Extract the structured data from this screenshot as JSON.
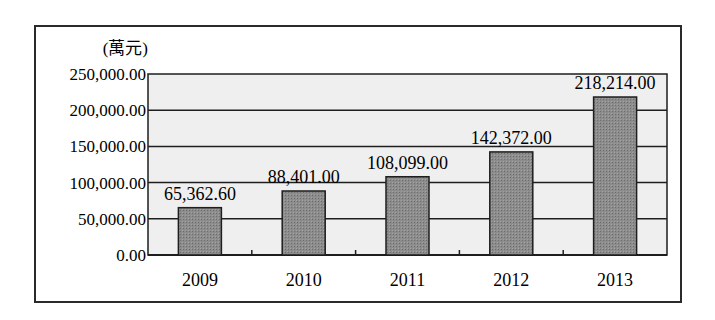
{
  "chart_data": {
    "type": "bar",
    "title": "",
    "unit_label": "(萬元)",
    "xlabel": "",
    "ylabel": "(萬元)",
    "categories": [
      "2009",
      "2010",
      "2011",
      "2012",
      "2013"
    ],
    "values": [
      65362.6,
      88401.0,
      108099.0,
      142372.0,
      218214.0
    ],
    "data_labels": [
      "65,362.60",
      "88,401.00",
      "108,099.00",
      "142,372.00",
      "218,214.00"
    ],
    "ylim": [
      0,
      250000
    ],
    "yticks": [
      0,
      50000,
      100000,
      150000,
      200000,
      250000
    ],
    "ytick_labels": [
      "0.00",
      "50,000.00",
      "100,000.00",
      "150,000.00",
      "200,000.00",
      "250,000.00"
    ],
    "grid": true,
    "legend": null,
    "colors": {
      "bar_fill": "#8a8a8a",
      "bar_stroke": "#1e1e1e",
      "plot_bg": "#efefef",
      "grid": "#1e1e1e"
    }
  }
}
